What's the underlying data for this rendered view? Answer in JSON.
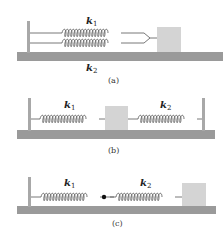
{
  "figure": {
    "panels": [
      {
        "id": "a",
        "caption": "(a)",
        "description": "Two springs in parallel attached to a wall and a block",
        "springs": [
          {
            "label": "k",
            "subscript": "1",
            "position": "top"
          },
          {
            "label": "k",
            "subscript": "2",
            "position": "bottom"
          }
        ]
      },
      {
        "id": "b",
        "caption": "(b)",
        "description": "Block between two springs attached to two walls",
        "springs": [
          {
            "label": "k",
            "subscript": "1",
            "position": "left"
          },
          {
            "label": "k",
            "subscript": "2",
            "position": "right"
          }
        ]
      },
      {
        "id": "c",
        "caption": "(c)",
        "description": "Two springs in series joined at a point, attached to a wall and a block",
        "springs": [
          {
            "label": "k",
            "subscript": "1",
            "position": "left"
          },
          {
            "label": "k",
            "subscript": "2",
            "position": "right"
          }
        ]
      }
    ],
    "colors": {
      "floor": "#9a9a9a",
      "wall": "#a8a8a8",
      "block": "#d4d4d4",
      "spring": "#555555",
      "dot": "#111111"
    }
  }
}
